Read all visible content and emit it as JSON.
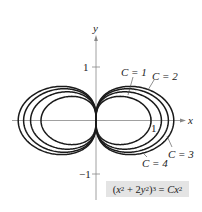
{
  "chart_data": {
    "type": "line",
    "title": "",
    "equation": "(x^2 + 2y^2)^3 = Cx^2",
    "xlabel": "x",
    "ylabel": "y",
    "xticks": [
      {
        "value": 1,
        "label": "1"
      }
    ],
    "yticks": [
      {
        "value": 1,
        "label": "1"
      },
      {
        "value": -1,
        "label": "−1"
      }
    ],
    "xlim": [
      -1.5,
      1.9
    ],
    "ylim": [
      -1.6,
      1.6
    ],
    "grid": false,
    "series": [
      {
        "name": "C = 1",
        "C": 1,
        "x_intercept": 1.0
      },
      {
        "name": "C = 2",
        "C": 2,
        "x_intercept": 1.189
      },
      {
        "name": "C = 3",
        "C": 3,
        "x_intercept": 1.316
      },
      {
        "name": "C = 4",
        "C": 4,
        "x_intercept": 1.414
      }
    ]
  },
  "labels": {
    "x_axis": "x",
    "y_axis": "y",
    "tick_y_pos": "1",
    "tick_y_neg": "−1",
    "tick_x_pos": "1",
    "c1": "C = 1",
    "c2": "C = 2",
    "c3": "C = 3",
    "c4": "C = 4"
  },
  "equation_box": {
    "open": "(",
    "x": "x",
    "plus": " + 2",
    "y": "y",
    "close": ")",
    "eq": " = ",
    "C": "C",
    "x2": "x",
    "sq": "2",
    "cube": "3"
  },
  "colors": {
    "curve": "#1a1a1a",
    "axis": "#888888",
    "box": "#e4e4e4"
  }
}
